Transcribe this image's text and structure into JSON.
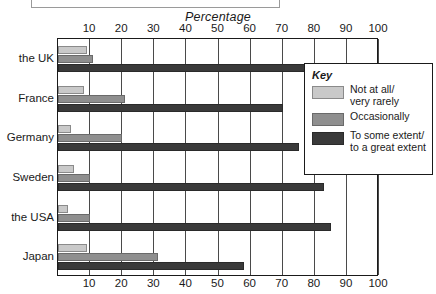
{
  "caption": {
    "text": ""
  },
  "legend": {
    "title": "Key",
    "items": [
      {
        "label": "Not at all/\nvery rarely",
        "color": "#c9c9c9"
      },
      {
        "label": "Occasionally",
        "color": "#8f8f8f"
      },
      {
        "label": "To some extent/\nto a great extent",
        "color": "#3a3a3a"
      }
    ]
  },
  "chart_data": {
    "type": "bar",
    "orientation": "horizontal",
    "title": "",
    "xlabel": "Percentage",
    "ylabel": "",
    "xlim": [
      0,
      100
    ],
    "xticks": [
      10,
      20,
      30,
      40,
      50,
      60,
      70,
      80,
      90,
      100
    ],
    "xtick_labels": [
      "10",
      "20",
      "30",
      "40",
      "50",
      "60",
      "70",
      "80",
      "90",
      "100"
    ],
    "axis_labels_position": "top-and-bottom",
    "grid": true,
    "legend_position": "inside-right",
    "categories": [
      "the UK",
      "France",
      "Germany",
      "Sweden",
      "the USA",
      "Japan"
    ],
    "series": [
      {
        "name": "Not at all/very rarely",
        "color": "#c9c9c9",
        "values": [
          9,
          8,
          4,
          5,
          3,
          9
        ]
      },
      {
        "name": "Occasionally",
        "color": "#8f8f8f",
        "values": [
          11,
          21,
          20,
          10,
          10,
          31
        ]
      },
      {
        "name": "To some extent/to a great extent",
        "color": "#3a3a3a",
        "values": [
          77,
          70,
          75,
          83,
          85,
          58
        ]
      }
    ]
  }
}
